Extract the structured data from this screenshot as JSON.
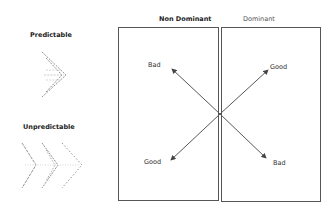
{
  "left_panel": {
    "predictable_label": "Predictable",
    "unpredictable_label": "Unpredictable"
  },
  "quadrant": {
    "columns": [
      {
        "label": "Non Dominant",
        "bold": true
      },
      {
        "label": "Dominant",
        "bold": false
      }
    ],
    "arrows": [
      {
        "direction": "up-left",
        "label": "Bad"
      },
      {
        "direction": "up-right",
        "label": "Good"
      },
      {
        "direction": "down-left",
        "label": "Good"
      },
      {
        "direction": "down-right",
        "label": "Bad"
      }
    ]
  },
  "colors": {
    "line": "#555555",
    "arrow": "#444444",
    "text": "#333333"
  }
}
